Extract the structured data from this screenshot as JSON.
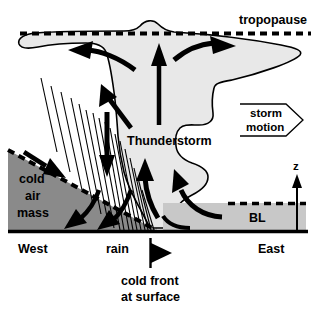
{
  "figure": {
    "title_alt": "Thunderstorm along a cold front cross-section",
    "background": "#ffffff",
    "width": 326,
    "height": 309
  },
  "colors": {
    "cloud_fill": "#e8e8e8",
    "cold_air_fill": "#8a8a8a",
    "boundary_layer_fill": "#c8c8c8",
    "stroke": "#000000",
    "cold_air_text": "#ffffff"
  },
  "labels": {
    "tropopause": "tropopause",
    "thunderstorm": "Thunderstorm",
    "storm_motion_line1": "storm",
    "storm_motion_line2": "motion",
    "cold_air_line1": "cold",
    "cold_air_line2": "air",
    "cold_air_line3": "mass",
    "boundary_layer": "BL",
    "west": "West",
    "east": "East",
    "rain": "rain",
    "cold_front_line1": "cold front",
    "cold_front_line2": "at surface",
    "vertical_axis": "z"
  },
  "icons": {
    "storm_motion": "block-arrow-right-icon",
    "cold_front": "cold-front-symbol-icon",
    "z_axis": "axis-arrow-up-icon",
    "updraft": "updraft-arrow-icon",
    "anvil_outflow_left": "outflow-arrow-left-icon",
    "anvil_outflow_right": "outflow-arrow-right-icon",
    "inflow": "inflow-arrow-icon",
    "downdraft": "downdraft-arrow-icon",
    "rain_shafts": "rain-shaft-lines-icon",
    "tropopause_line": "dashed-line-icon",
    "ground_line": "surface-line-icon"
  },
  "annotations": {
    "tropopause_note": "dashed horizontal line marking top of troposphere",
    "surface_note": "thick solid line marking the ground surface"
  }
}
